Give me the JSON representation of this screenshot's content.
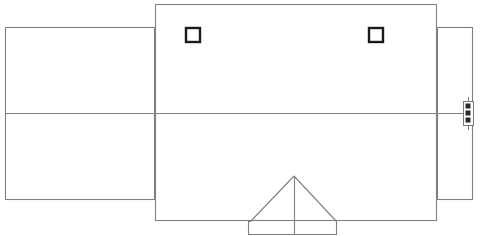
{
  "drawing": {
    "title": "Building Roof Plan",
    "type": "architectural-line-drawing",
    "canvas": {
      "width": 480,
      "height": 236
    },
    "style": {
      "background_color": "#ffffff",
      "line_color": "#808080",
      "line_color_dark": "#1a1a1a",
      "line_width": 1.1,
      "fill": "none"
    },
    "shapes": {
      "left_wing": {
        "name": "left-wing-rectangle",
        "x": 5,
        "y": 27,
        "width": 150,
        "height": 173,
        "label": "Left Wing"
      },
      "main_block": {
        "name": "main-block-rectangle",
        "x": 155,
        "y": 4,
        "width": 282,
        "height": 217,
        "label": "Main Block"
      },
      "right_wing": {
        "name": "right-wing-rectangle",
        "x": 437,
        "y": 27,
        "width": 36,
        "height": 173,
        "label": "Right Wing"
      },
      "ridge_line": {
        "name": "horizontal-ridge-line",
        "x1": 5,
        "y1": 113,
        "x2": 473,
        "y2": 113,
        "label": "Ridge Line"
      },
      "porch_gable": {
        "name": "porch-gable-triangle",
        "apex_x": 294,
        "apex_y": 176,
        "left_x": 250,
        "right_x": 337,
        "base_y": 221,
        "label": "Porch Gable"
      },
      "porch_ridge": {
        "name": "porch-center-ridge",
        "x1": 294,
        "y1": 176,
        "x2": 294,
        "y2": 234,
        "label": "Porch Ridge"
      },
      "porch_slab": {
        "name": "porch-slab-rectangle",
        "x": 248,
        "y": 221,
        "width": 89,
        "height": 13,
        "label": "Porch Slab"
      }
    },
    "windows": [
      {
        "name": "window-left",
        "x": 186,
        "y": 28,
        "width": 14,
        "height": 14,
        "label": "Skylight Left"
      },
      {
        "name": "window-right",
        "x": 369,
        "y": 28,
        "width": 14,
        "height": 14,
        "label": "Skylight Right"
      }
    ],
    "fixture": {
      "name": "right-edge-fixture",
      "x": 463,
      "y": 101,
      "width": 11,
      "height": 25,
      "slots": 3,
      "label": "Vent Stack"
    }
  }
}
